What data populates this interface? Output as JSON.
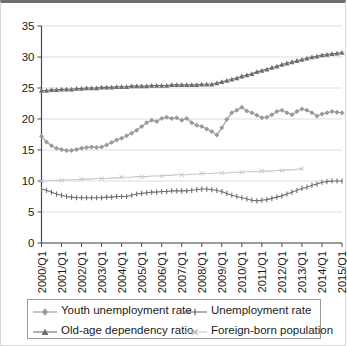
{
  "chart_data": {
    "type": "line",
    "title": "",
    "xlabel": "",
    "ylabel": "",
    "ylim": [
      0,
      35
    ],
    "ytick_labels": [
      "0",
      "5",
      "10",
      "15",
      "20",
      "25",
      "30",
      "35"
    ],
    "ytick_values": [
      0,
      5,
      10,
      15,
      20,
      25,
      30,
      35
    ],
    "grid": true,
    "legend_position": "bottom",
    "xtick_labels": [
      "2000/Q1",
      "2001/Q1",
      "2002/Q1",
      "2003/Q1",
      "2004/Q1",
      "2005/Q1",
      "2006/Q1",
      "2007/Q1",
      "2008/Q1",
      "2009/Q1",
      "2010/Q1",
      "2011/Q1",
      "2012/Q1",
      "2013/Q1",
      "2014/Q1",
      "2015/Q1"
    ],
    "x": [
      "2000/Q1",
      "2000/Q2",
      "2000/Q3",
      "2000/Q4",
      "2001/Q1",
      "2001/Q2",
      "2001/Q3",
      "2001/Q4",
      "2002/Q1",
      "2002/Q2",
      "2002/Q3",
      "2002/Q4",
      "2003/Q1",
      "2003/Q2",
      "2003/Q3",
      "2003/Q4",
      "2004/Q1",
      "2004/Q2",
      "2004/Q3",
      "2004/Q4",
      "2005/Q1",
      "2005/Q2",
      "2005/Q3",
      "2005/Q4",
      "2006/Q1",
      "2006/Q2",
      "2006/Q3",
      "2006/Q4",
      "2007/Q1",
      "2007/Q2",
      "2007/Q3",
      "2007/Q4",
      "2008/Q1",
      "2008/Q2",
      "2008/Q3",
      "2008/Q4",
      "2009/Q1",
      "2009/Q2",
      "2009/Q3",
      "2009/Q4",
      "2010/Q1",
      "2010/Q2",
      "2010/Q3",
      "2010/Q4",
      "2011/Q1",
      "2011/Q2",
      "2011/Q3",
      "2011/Q4",
      "2012/Q1",
      "2012/Q2",
      "2012/Q3",
      "2012/Q4",
      "2013/Q1",
      "2013/Q2",
      "2013/Q3",
      "2013/Q4",
      "2014/Q1",
      "2014/Q2",
      "2014/Q3",
      "2014/Q4",
      "2015/Q1"
    ],
    "series": [
      {
        "name": "Youth unemployment rate",
        "marker": "diamond",
        "color": "#9a9a9a",
        "values": [
          17.2,
          16.3,
          15.7,
          15.3,
          15.1,
          14.9,
          14.9,
          15.1,
          15.3,
          15.4,
          15.5,
          15.4,
          15.5,
          15.8,
          16.2,
          16.6,
          16.9,
          17.3,
          17.7,
          18.2,
          18.8,
          19.4,
          19.8,
          19.6,
          20.1,
          20.3,
          20.1,
          20.2,
          19.8,
          20.1,
          19.4,
          19.0,
          18.8,
          18.4,
          18.0,
          17.4,
          18.6,
          19.9,
          21.0,
          21.4,
          21.9,
          21.3,
          21.0,
          20.6,
          20.2,
          20.3,
          20.7,
          21.2,
          21.4,
          21.0,
          20.7,
          21.2,
          21.6,
          21.4,
          21.0,
          20.5,
          20.8,
          21.0,
          21.2,
          21.1,
          21.0
        ]
      },
      {
        "name": "Old-age dependency ratio",
        "marker": "triangle",
        "color": "#6e6e6e",
        "values": [
          24.6,
          24.6,
          24.7,
          24.7,
          24.8,
          24.8,
          24.8,
          24.9,
          24.9,
          25.0,
          25.0,
          25.0,
          25.1,
          25.1,
          25.1,
          25.2,
          25.2,
          25.2,
          25.3,
          25.3,
          25.3,
          25.3,
          25.4,
          25.4,
          25.4,
          25.4,
          25.5,
          25.5,
          25.5,
          25.5,
          25.5,
          25.5,
          25.6,
          25.6,
          25.6,
          25.8,
          26.0,
          26.2,
          26.4,
          26.6,
          26.9,
          27.1,
          27.3,
          27.6,
          27.8,
          28.0,
          28.3,
          28.5,
          28.8,
          29.0,
          29.2,
          29.4,
          29.6,
          29.8,
          30.0,
          30.1,
          30.3,
          30.4,
          30.5,
          30.6,
          30.7
        ]
      },
      {
        "name": "Unemployment rate",
        "marker": "plus",
        "color": "#6e6e6e",
        "values": [
          8.7,
          8.5,
          8.2,
          7.9,
          7.7,
          7.5,
          7.4,
          7.3,
          7.3,
          7.3,
          7.3,
          7.3,
          7.3,
          7.4,
          7.4,
          7.5,
          7.5,
          7.5,
          7.7,
          7.9,
          8.0,
          8.1,
          8.2,
          8.2,
          8.3,
          8.3,
          8.4,
          8.4,
          8.4,
          8.4,
          8.5,
          8.6,
          8.7,
          8.7,
          8.6,
          8.5,
          8.3,
          8.0,
          7.7,
          7.5,
          7.3,
          7.1,
          6.9,
          6.8,
          6.9,
          7.0,
          7.2,
          7.4,
          7.6,
          7.9,
          8.2,
          8.5,
          8.8,
          9.0,
          9.3,
          9.5,
          9.8,
          9.9,
          10.0,
          10.0,
          10.0
        ]
      },
      {
        "name": "Foreign-born population",
        "marker": "cross",
        "color": "#c6c6c6",
        "values": [
          10.0,
          10.0,
          10.1,
          10.1,
          10.1,
          10.2,
          10.2,
          10.2,
          10.3,
          10.3,
          10.3,
          10.4,
          10.4,
          10.4,
          10.5,
          10.5,
          10.6,
          10.6,
          10.6,
          10.7,
          10.7,
          10.7,
          10.8,
          10.8,
          10.8,
          10.9,
          10.9,
          11.0,
          11.0,
          11.0,
          11.1,
          11.1,
          11.2,
          11.2,
          11.2,
          11.3,
          11.3,
          11.3,
          11.4,
          11.4,
          11.4,
          11.5,
          11.5,
          11.5,
          11.6,
          11.6,
          11.6,
          11.7,
          11.7,
          11.8,
          11.8,
          11.9,
          12.0,
          null,
          null,
          null,
          null,
          null,
          null,
          null,
          null
        ]
      }
    ]
  },
  "legend": {
    "entries": [
      {
        "label": "Youth unemployment rate"
      },
      {
        "label": "Unemployment rate"
      },
      {
        "label": "Old-age dependency ratio"
      },
      {
        "label": "Foreign-born population"
      }
    ]
  }
}
